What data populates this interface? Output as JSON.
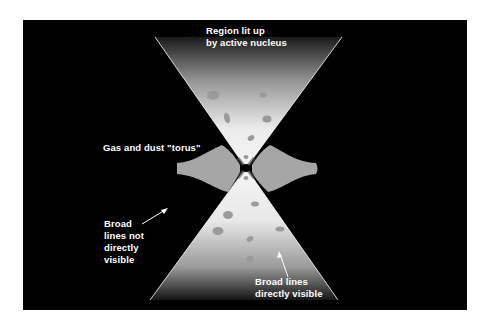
{
  "diagram": {
    "colors": {
      "background": "#000000",
      "page": "#ffffff",
      "cone_light": "#f2f2f2",
      "cone_dark": "#1a1a1a",
      "torus": "#a6a6a6",
      "clouds": "#9a9a9a",
      "nucleus": "#000000",
      "label_text": "#ffffff"
    },
    "labels": {
      "top_region": "Region lit up\nby active nucleus",
      "torus": "Gas and dust \"torus\"",
      "broad_not_visible": "Broad\nlines not\ndirectly\nvisible",
      "broad_visible": "Broad lines\ndirectly visible"
    },
    "elements": {
      "upper_cone": "ionization-cone-upper",
      "lower_cone": "ionization-cone-lower",
      "torus": "dust-torus",
      "nucleus": "active-nucleus",
      "arrow_left": "arrow-to-hidden-region",
      "arrow_bottom": "arrow-to-visible-region"
    }
  }
}
